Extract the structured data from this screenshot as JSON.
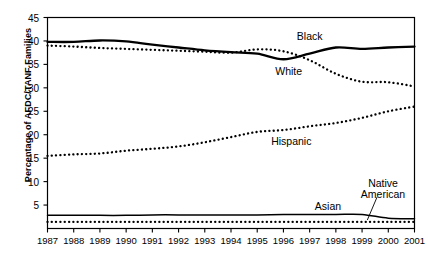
{
  "chart_data": {
    "type": "line",
    "title": "",
    "xlabel": "",
    "ylabel": "Percentage of AFDC/TANF Families",
    "x": [
      1987,
      1988,
      1989,
      1990,
      1991,
      1992,
      1993,
      1994,
      1995,
      1996,
      1997,
      1998,
      1999,
      2000,
      2001
    ],
    "categories": [
      "1987",
      "1988",
      "1989",
      "1990",
      "1991",
      "1992",
      "1993",
      "1994",
      "1995",
      "1996",
      "1997",
      "1998",
      "1999",
      "2000",
      "2001"
    ],
    "xlim": [
      1987,
      2001
    ],
    "ylim": [
      0,
      45
    ],
    "yticks": [
      5,
      10,
      15,
      20,
      25,
      30,
      35,
      40,
      45
    ],
    "ytick_labels": [
      "5",
      "10",
      "15",
      "20",
      "25",
      "30",
      "35",
      "40",
      "45"
    ],
    "grid": false,
    "legend": "inline-annotations",
    "series": [
      {
        "name": "Black",
        "style": "solid",
        "color": "#000000",
        "values": [
          39.8,
          39.8,
          40.1,
          39.9,
          39.2,
          38.6,
          38.0,
          37.6,
          37.3,
          36.1,
          37.3,
          38.6,
          38.3,
          38.6,
          38.8
        ]
      },
      {
        "name": "White",
        "style": "dotted",
        "color": "#000000",
        "values": [
          39.0,
          38.8,
          38.5,
          38.3,
          38.1,
          37.9,
          37.7,
          37.5,
          38.2,
          37.8,
          35.9,
          33.0,
          31.3,
          31.2,
          30.3
        ]
      },
      {
        "name": "Hispanic",
        "style": "dotted",
        "color": "#000000",
        "values": [
          15.5,
          15.8,
          16.0,
          16.6,
          17.0,
          17.5,
          18.4,
          19.5,
          20.6,
          21.0,
          21.8,
          22.5,
          23.6,
          25.0,
          26.0
        ]
      },
      {
        "name": "Asian",
        "style": "solid",
        "color": "#000000",
        "values": [
          2.8,
          2.8,
          2.8,
          2.8,
          2.9,
          2.9,
          2.9,
          2.9,
          2.9,
          3.0,
          3.0,
          3.0,
          3.0,
          2.2,
          2.1
        ]
      },
      {
        "name": "Native American",
        "style": "dotted",
        "color": "#000000",
        "values": [
          1.4,
          1.4,
          1.4,
          1.4,
          1.4,
          1.4,
          1.4,
          1.4,
          1.4,
          1.4,
          1.4,
          1.4,
          1.4,
          1.4,
          1.4
        ]
      }
    ],
    "annotations": [
      {
        "text": "Black",
        "x": 1997.0,
        "y": 41.0
      },
      {
        "text": "White",
        "x": 1996.2,
        "y": 33.6
      },
      {
        "text": "Hispanic",
        "x": 1996.3,
        "y": 18.6
      },
      {
        "text": "Asian",
        "x": 1997.7,
        "y": 4.9
      },
      {
        "text": "Native\nAmerican",
        "x": 1999.8,
        "y": 8.4,
        "leader_to": {
          "x": 1999.2,
          "y": 1.8
        }
      }
    ]
  },
  "axis": {
    "y_title": "Percentage of AFDC/TANF Families"
  },
  "labels": {
    "black": "Black",
    "white": "White",
    "hispanic": "Hispanic",
    "asian": "Asian",
    "native_american_line1": "Native",
    "native_american_line2": "American"
  }
}
